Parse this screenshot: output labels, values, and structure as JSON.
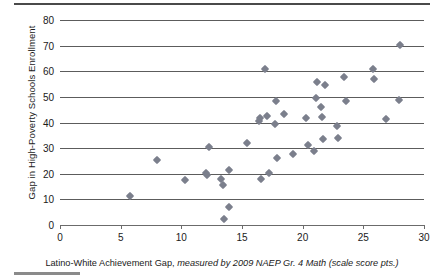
{
  "chart_data": {
    "type": "scatter",
    "title": "",
    "xlabel": "Latino-White Achievement Gap, measured by 2009 NAEP Gr. 4 Math (scale score pts.)",
    "ylabel": "Gap in High-Poverty Schools Enrollment",
    "xlabel_plain_prefix": "Latino-White Achievement Gap,",
    "xlabel_italic": "measured by 2009 NAEP Gr. 4 Math (scale score pts.)",
    "xlim": [
      0,
      30
    ],
    "ylim": [
      0,
      80
    ],
    "xticks": [
      0,
      5,
      10,
      15,
      20,
      25,
      30
    ],
    "yticks": [
      0,
      10,
      20,
      30,
      40,
      50,
      60,
      70,
      80
    ],
    "grid": "horizontal",
    "legend": "none",
    "marker": "diamond",
    "marker_color": "#7b7f8c",
    "points": [
      [
        5.8,
        11.5
      ],
      [
        8.0,
        25.4
      ],
      [
        10.3,
        17.4
      ],
      [
        12.0,
        20.2
      ],
      [
        12.1,
        19.4
      ],
      [
        12.3,
        30.6
      ],
      [
        13.3,
        18.0
      ],
      [
        13.4,
        15.6
      ],
      [
        13.5,
        2.3
      ],
      [
        13.9,
        21.6
      ],
      [
        13.9,
        7.2
      ],
      [
        15.4,
        32.0
      ],
      [
        16.4,
        40.5
      ],
      [
        16.5,
        41.6
      ],
      [
        16.6,
        18.0
      ],
      [
        16.9,
        60.7
      ],
      [
        17.1,
        42.4
      ],
      [
        17.2,
        20.2
      ],
      [
        17.7,
        39.6
      ],
      [
        17.8,
        48.5
      ],
      [
        17.9,
        26.3
      ],
      [
        18.5,
        43.4
      ],
      [
        19.2,
        27.6
      ],
      [
        20.3,
        41.6
      ],
      [
        20.4,
        31.2
      ],
      [
        20.9,
        29.0
      ],
      [
        21.1,
        49.5
      ],
      [
        21.2,
        56.0
      ],
      [
        21.5,
        46.1
      ],
      [
        21.6,
        42.0
      ],
      [
        21.7,
        33.7
      ],
      [
        21.8,
        54.7
      ],
      [
        22.8,
        38.5
      ],
      [
        22.9,
        34.1
      ],
      [
        23.4,
        57.6
      ],
      [
        23.6,
        48.5
      ],
      [
        25.8,
        60.9
      ],
      [
        25.9,
        57.1
      ],
      [
        26.9,
        41.3
      ],
      [
        27.9,
        48.7
      ],
      [
        28.0,
        70.4
      ]
    ]
  }
}
